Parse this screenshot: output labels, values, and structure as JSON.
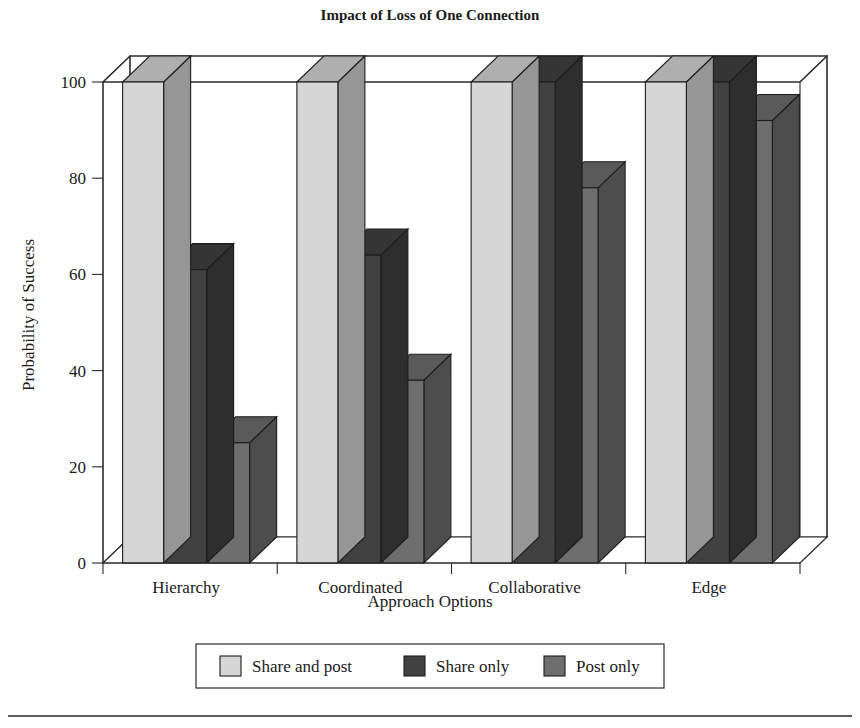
{
  "chart_data": {
    "type": "bar",
    "title": "Impact of Loss of One Connection",
    "xlabel": "Approach Options",
    "ylabel": "Probability of Success",
    "categories": [
      "Hierarchy",
      "Coordinated",
      "Collaborative",
      "Edge"
    ],
    "series": [
      {
        "name": "Share and post",
        "color": "#d6d6d6",
        "values": [
          100,
          100,
          100,
          100
        ]
      },
      {
        "name": "Share only",
        "color": "#414141",
        "values": [
          61,
          64,
          100,
          100
        ]
      },
      {
        "name": "Post only",
        "color": "#6e6e6e",
        "values": [
          25,
          38,
          78,
          92
        ]
      }
    ],
    "ylim": [
      0,
      100
    ],
    "yticks": [
      0,
      20,
      40,
      60,
      80,
      100
    ],
    "ytick_labels": [
      "0",
      "20",
      "40",
      "60",
      "80",
      "100"
    ],
    "grid": false,
    "legend_position": "bottom",
    "projection": "3d"
  },
  "legend": {
    "entries": [
      {
        "label": "Share and post",
        "color": "#d6d6d6"
      },
      {
        "label": "Share only",
        "color": "#414141"
      },
      {
        "label": "Post only",
        "color": "#6e6e6e"
      }
    ]
  }
}
